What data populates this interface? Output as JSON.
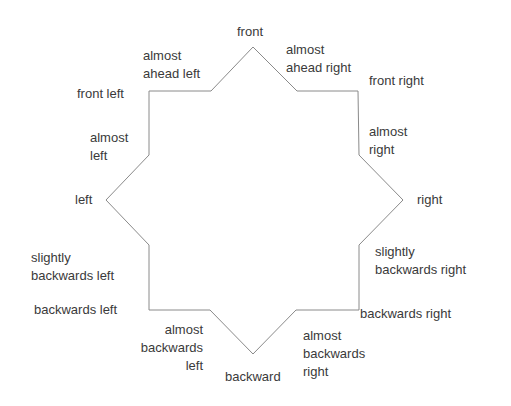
{
  "diagram": {
    "type": "eight-point-star-directions",
    "stroke_color": "#8a8a8a",
    "text_color": "#3a3a3a",
    "labels": {
      "front": "front",
      "almost_ahead_left_1": "almost",
      "almost_ahead_left_2": "ahead left",
      "almost_ahead_right_1": "almost",
      "almost_ahead_right_2": "ahead right",
      "front_left": "front left",
      "front_right": "front right",
      "almost_left_1": "almost",
      "almost_left_2": "left",
      "almost_right_1": "almost",
      "almost_right_2": "right",
      "left": "left",
      "right": "right",
      "slightly_backwards_left_1": "slightly",
      "slightly_backwards_left_2": "backwards left",
      "slightly_backwards_right_1": "slightly",
      "slightly_backwards_right_2": "backwards right",
      "backwards_left": "backwards left",
      "backwards_right": "backwards right",
      "almost_backwards_left_1": "almost",
      "almost_backwards_left_2": "backwards",
      "almost_backwards_left_3": "left",
      "almost_backwards_right_1": "almost",
      "almost_backwards_right_2": "backwards",
      "almost_backwards_right_3": "right",
      "backward": "backward"
    }
  }
}
